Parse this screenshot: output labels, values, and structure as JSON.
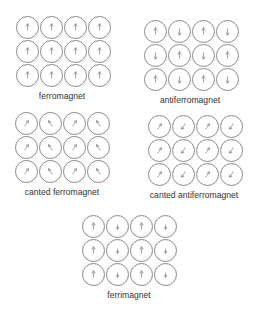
{
  "colors": {
    "circle": "#8a8a8a",
    "arrow": "#777777",
    "text": "#333333"
  },
  "panels": [
    {
      "id": "ferromagnet",
      "label": "ferromagnet",
      "x": 15,
      "y": 15,
      "label_x": 62,
      "label_y": 91,
      "arrows": [
        [
          "up",
          "up",
          "up",
          "up"
        ],
        [
          "up",
          "up",
          "up",
          "up"
        ],
        [
          "up",
          "up",
          "up",
          "up"
        ]
      ]
    },
    {
      "id": "antiferromagnet",
      "label": "antiferromagnet",
      "x": 143,
      "y": 19,
      "label_x": 190,
      "label_y": 95,
      "arrows": [
        [
          "up",
          "down",
          "up",
          "down"
        ],
        [
          "down",
          "up",
          "down",
          "up"
        ],
        [
          "up",
          "down",
          "up",
          "down"
        ]
      ]
    },
    {
      "id": "canted-ferromagnet",
      "label": "canted ferromagnet",
      "x": 14,
      "y": 111,
      "label_x": 62,
      "label_y": 187,
      "arrows": [
        [
          "up-right",
          "up-left",
          "up-right",
          "up-left"
        ],
        [
          "up-right",
          "up-left",
          "up-right",
          "up-left"
        ],
        [
          "up-right",
          "up-left",
          "up-right",
          "up-left"
        ]
      ]
    },
    {
      "id": "canted-antiferromagnet",
      "label": "canted antiferromagnet",
      "x": 147,
      "y": 114,
      "label_x": 194,
      "label_y": 190,
      "arrows": [
        [
          "up-right",
          "down-left",
          "up-right",
          "down-left"
        ],
        [
          "up-right",
          "down-left",
          "up-right",
          "down-left"
        ],
        [
          "up-right",
          "down-left",
          "up-right",
          "down-left"
        ]
      ]
    },
    {
      "id": "ferrimagnet",
      "label": "ferrimagnet",
      "x": 81,
      "y": 214,
      "label_x": 129,
      "label_y": 290,
      "arrows": [
        [
          "up",
          "down-short",
          "up",
          "down-short"
        ],
        [
          "up",
          "down-short",
          "up",
          "down-short"
        ],
        [
          "up",
          "down-short",
          "up",
          "down-short"
        ]
      ]
    }
  ]
}
